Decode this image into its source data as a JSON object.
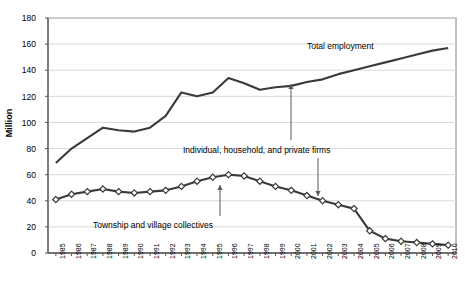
{
  "chart_data": {
    "type": "line",
    "title": "",
    "xlabel": "",
    "ylabel": "Million",
    "ylim": [
      0,
      180
    ],
    "ytick_values": [
      0,
      20,
      40,
      60,
      80,
      100,
      120,
      140,
      160,
      180
    ],
    "grid": true,
    "legend_position": "inline-annotations",
    "categories": [
      "1985",
      "1986",
      "1987",
      "1988",
      "1989",
      "1990",
      "1991",
      "1992",
      "1993",
      "1994",
      "1995",
      "1996",
      "1997",
      "1998",
      "1999",
      "2000",
      "2001",
      "2002",
      "2003",
      "2004",
      "2005",
      "2006",
      "2007",
      "2008",
      "2009",
      "2010"
    ],
    "series": [
      {
        "name": "Total employment",
        "marker": "none",
        "color": "#3a3a3a",
        "values": [
          69,
          80,
          88,
          96,
          94,
          93,
          96,
          105,
          123,
          120,
          123,
          134,
          130,
          125,
          127,
          128,
          131,
          133,
          137,
          140,
          143,
          146,
          149,
          152,
          155,
          157
        ]
      },
      {
        "name": "Township and village collectives",
        "marker": "diamond",
        "color": "#3a3a3a",
        "values": [
          41,
          45,
          47,
          49,
          47,
          46,
          47,
          48,
          51,
          55,
          58,
          60,
          59,
          55,
          51,
          48,
          44,
          40,
          37,
          34,
          17,
          11,
          9,
          8,
          7,
          6
        ]
      }
    ],
    "annotations": [
      {
        "text": "Total employment",
        "target_series": "Total employment",
        "arrow": false
      },
      {
        "text": "Individual, household, and private firms",
        "target_series": "Total employment",
        "arrow": true
      },
      {
        "text": "Township and village collectives",
        "target_series": "Township and village collectives",
        "arrow": true
      }
    ]
  }
}
